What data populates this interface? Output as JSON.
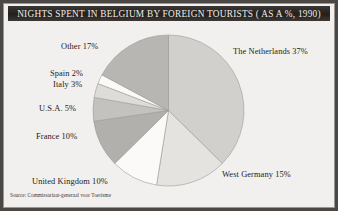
{
  "title": "NIGHTS SPENT IN BELGIUM BY FOREIGN TOURISTS ( AS A %, 1990)",
  "source": "Source: Commissariaat-generaal voor Toerisme",
  "labels": {
    "netherlands": "The Netherlands 37%",
    "west_germany": "West Germany 15%",
    "other": "Other 17%",
    "spain": "Spain 2%",
    "italy": "Italy 3%",
    "usa": "U.S.A. 5%",
    "france": "France 10%",
    "united_kingdom": "United Kingdom 10%"
  },
  "colors": {
    "page_background": "#f2f0ee",
    "frame": "#4a4744",
    "title_bar": "#2b2724",
    "title_text": "#efece7",
    "label_text": "#1d1a18",
    "pie_outline": "#9c9a97"
  },
  "chart_data": {
    "type": "pie",
    "title": "NIGHTS SPENT IN BELGIUM BY FOREIGN TOURISTS ( AS A %, 1990)",
    "unit": "%",
    "legend": "none",
    "labels_position": "outside",
    "start_angle_deg": 0,
    "direction": "clockwise",
    "categories": [
      "The Netherlands",
      "West Germany",
      "United Kingdom",
      "France",
      "U.S.A.",
      "Italy",
      "Spain",
      "Other"
    ],
    "values": [
      37,
      15,
      10,
      10,
      5,
      3,
      2,
      17
    ],
    "slice_colors": [
      "#d2d0cd",
      "#e5e3e0",
      "#fbfaf9",
      "#b2b0ad",
      "#c4c2bf",
      "#dedcd9",
      "#fbfaf9",
      "#b8b6b3"
    ],
    "slice_labels": [
      "The Netherlands 37%",
      "West Germany 15%",
      "United Kingdom 10%",
      "France 10%",
      "U.S.A. 5%",
      "Italy 3%",
      "Spain 2%",
      "Other 17%"
    ],
    "total": 99,
    "xlabel": "",
    "ylabel": ""
  }
}
